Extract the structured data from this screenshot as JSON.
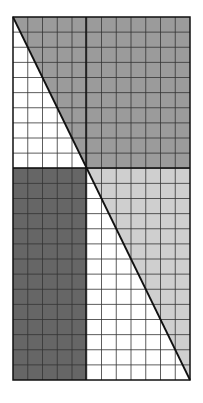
{
  "diagram": {
    "grid": {
      "cols": 12,
      "rows": 24
    },
    "colors": {
      "top_region": "#9b9b9b",
      "bottom_left": "#666666",
      "bottom_right": "#cfcfcf",
      "background": "#ffffff",
      "lines": "#222222"
    }
  }
}
